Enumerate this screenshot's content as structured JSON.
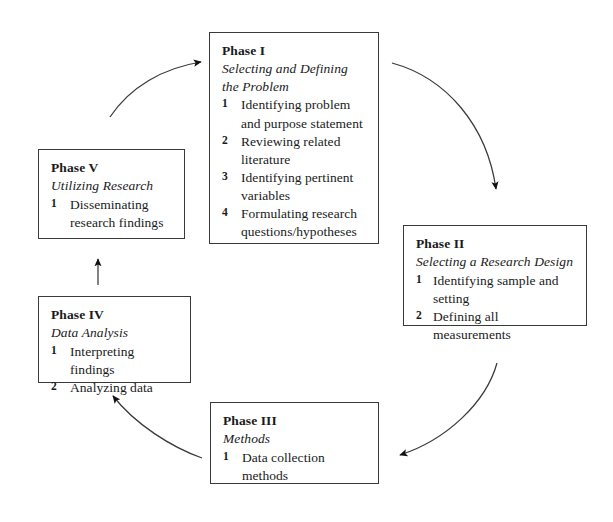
{
  "diagram": {
    "background_color": "#ffffff",
    "stroke_color": "#3a3a3a",
    "text_color": "#1a1a1a"
  },
  "phases": [
    {
      "id": "phase-1",
      "title": "Phase I",
      "subtitle": "Selecting and Defining the Problem",
      "steps": [
        {
          "num": "1",
          "text": "Identifying problem and purpose statement"
        },
        {
          "num": "2",
          "text": "Reviewing related literature"
        },
        {
          "num": "3",
          "text": "Identifying pertinent variables"
        },
        {
          "num": "4",
          "text": "Formulating research questions/hypotheses"
        }
      ]
    },
    {
      "id": "phase-2",
      "title": "Phase II",
      "subtitle": "Selecting a Research Design",
      "steps": [
        {
          "num": "1",
          "text": "Identifying sample and setting"
        },
        {
          "num": "2",
          "text": "Defining all measurements"
        }
      ]
    },
    {
      "id": "phase-3",
      "title": "Phase III",
      "subtitle": "Methods",
      "steps": [
        {
          "num": "1",
          "text": "Data collection methods"
        }
      ]
    },
    {
      "id": "phase-4",
      "title": "Phase IV",
      "subtitle": "Data Analysis",
      "steps": [
        {
          "num": "1",
          "text": "Interpreting findings"
        },
        {
          "num": "2",
          "text": "Analyzing data"
        }
      ]
    },
    {
      "id": "phase-5",
      "title": "Phase V",
      "subtitle": "Utilizing Research",
      "steps": [
        {
          "num": "1",
          "text": "Disseminating research findings"
        }
      ]
    }
  ],
  "connectors": [
    {
      "id": "arrow-phase1-to-phase2",
      "from": "Phase I",
      "to": "Phase II",
      "direction": "clockwise-curve"
    },
    {
      "id": "arrow-phase2-to-phase3",
      "from": "Phase II",
      "to": "Phase III",
      "direction": "clockwise-curve"
    },
    {
      "id": "arrow-phase3-to-phase4",
      "from": "Phase III",
      "to": "Phase IV",
      "direction": "clockwise-curve"
    },
    {
      "id": "arrow-phase4-to-phase5",
      "from": "Phase IV",
      "to": "Phase V",
      "direction": "straight-up"
    },
    {
      "id": "arrow-phase5-to-phase1",
      "from": "Phase V",
      "to": "Phase I",
      "direction": "clockwise-curve"
    }
  ]
}
